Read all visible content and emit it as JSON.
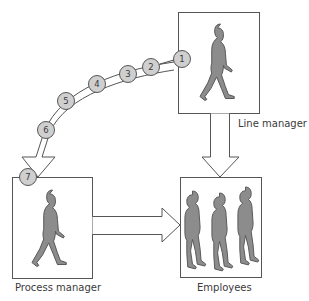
{
  "diagram": {
    "nodes": {
      "line_manager": {
        "label": "Line manager"
      },
      "process_manager": {
        "label": "Process manager"
      },
      "employees": {
        "label": "Employees"
      }
    },
    "steps": [
      "1",
      "2",
      "3",
      "4",
      "5",
      "6",
      "7"
    ],
    "colors": {
      "stroke": "#555555",
      "figure_fill": "#8c8c8c",
      "circle_fill": "#cfcfcf",
      "background": "#ffffff"
    }
  }
}
